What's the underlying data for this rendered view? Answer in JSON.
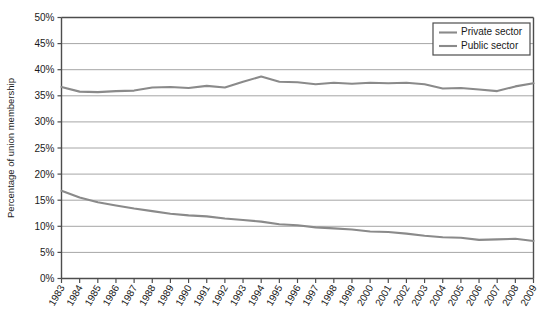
{
  "chart_data": {
    "type": "line",
    "title": "",
    "xlabel": "",
    "ylabel": "Percentage of union membership",
    "ylim": [
      0,
      50
    ],
    "ytick_labels": [
      "0%",
      "5%",
      "10%",
      "15%",
      "20%",
      "25%",
      "30%",
      "35%",
      "40%",
      "45%",
      "50%"
    ],
    "ytick_values": [
      0,
      5,
      10,
      15,
      20,
      25,
      30,
      35,
      40,
      45,
      50
    ],
    "grid": true,
    "legend_position": "top-right",
    "categories": [
      "1983",
      "1984",
      "1985",
      "1986",
      "1987",
      "1988",
      "1989",
      "1990",
      "1991",
      "1992",
      "1993",
      "1994",
      "1995",
      "1996",
      "1997",
      "1998",
      "1999",
      "2000",
      "2001",
      "2002",
      "2003",
      "2004",
      "2005",
      "2006",
      "2007",
      "2008",
      "2009"
    ],
    "series": [
      {
        "name": "Private sector",
        "color": "#8a8a8a",
        "values": [
          16.8,
          15.5,
          14.6,
          14.0,
          13.4,
          12.9,
          12.4,
          12.1,
          11.9,
          11.5,
          11.2,
          10.9,
          10.4,
          10.2,
          9.8,
          9.6,
          9.4,
          9.0,
          8.9,
          8.6,
          8.2,
          7.9,
          7.8,
          7.4,
          7.5,
          7.6,
          7.2
        ]
      },
      {
        "name": "Public sector",
        "color": "#8a8a8a",
        "values": [
          36.7,
          35.8,
          35.7,
          35.9,
          36.0,
          36.6,
          36.7,
          36.5,
          36.9,
          36.6,
          37.7,
          38.7,
          37.7,
          37.6,
          37.2,
          37.5,
          37.3,
          37.5,
          37.4,
          37.5,
          37.2,
          36.4,
          36.5,
          36.2,
          35.9,
          36.8,
          37.4
        ]
      }
    ],
    "legend_entries": [
      "Private sector",
      "Public sector"
    ]
  }
}
